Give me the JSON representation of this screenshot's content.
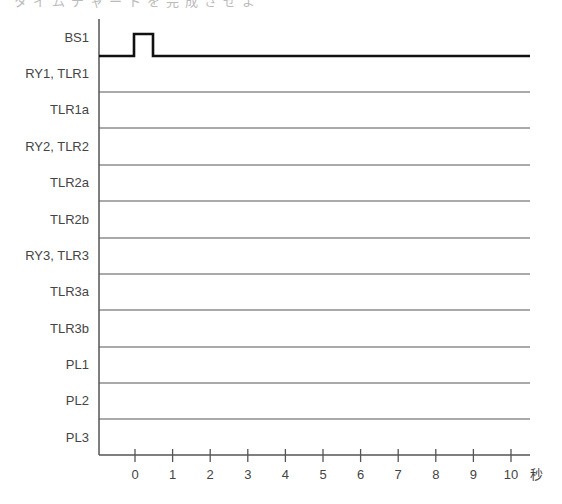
{
  "header": {
    "cut_off_text": "タイムチャートを完成させよ"
  },
  "diagram": {
    "type": "timing-chart",
    "axis_unit": "秒",
    "x_ticks": [
      "0",
      "1",
      "2",
      "3",
      "4",
      "5",
      "6",
      "7",
      "8",
      "9",
      "10"
    ],
    "rows": [
      {
        "label": "BS1"
      },
      {
        "label": "RY1, TLR1"
      },
      {
        "label": "TLR1a"
      },
      {
        "label": "RY2, TLR2"
      },
      {
        "label": "TLR2a"
      },
      {
        "label": "TLR2b"
      },
      {
        "label": "RY3, TLR3"
      },
      {
        "label": "TLR3a"
      },
      {
        "label": "TLR3b"
      },
      {
        "label": "PL1"
      },
      {
        "label": "PL2"
      },
      {
        "label": "PL3"
      }
    ],
    "signals": {
      "BS1": {
        "pulse_start_s": 0,
        "pulse_end_s": 0.5,
        "state_after": "off"
      }
    },
    "colors": {
      "signal": "#111111",
      "grid_line": "#555555",
      "text": "#444444"
    }
  }
}
